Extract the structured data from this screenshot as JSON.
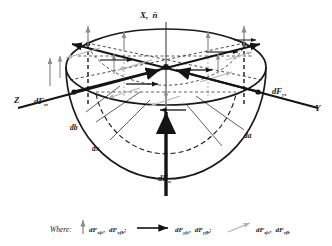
{
  "figure": {
    "title_axis_x": "X,",
    "title_axis_x_vector": "n̄",
    "axis_z": "Z",
    "axis_y": "Y",
    "force_z_tau_main": "dF",
    "force_z_tau_sub": "zτ",
    "force_y_tau_main": "dF",
    "force_y_tau_sub": "yτ",
    "force_n_main": "dF",
    "force_n_sub": "n",
    "dim_db": "db",
    "dim_dx": "dx",
    "dim_da": "da"
  },
  "legend": {
    "where_label": "Where:",
    "entries": [
      {
        "symbol": "vertical-gray-arrow",
        "color": "#8c8c8c",
        "terms": [
          {
            "main": "dF",
            "sub": "xfc"
          },
          {
            "main": "dF",
            "sub": "xfb"
          }
        ],
        "separator": ";"
      },
      {
        "symbol": "horizontal-black-arrow",
        "color": "#141414",
        "terms": [
          {
            "main": "dF",
            "sub": "yfc"
          },
          {
            "main": "dF",
            "sub": "yfb"
          }
        ],
        "separator": ";"
      },
      {
        "symbol": "diagonal-light-gray-arrow",
        "color": "#b4b4b4",
        "terms": [
          {
            "main": "dF",
            "sub": "zfc"
          },
          {
            "main": "dF",
            "sub": "zfb"
          }
        ],
        "separator": ""
      }
    ]
  },
  "colors": {
    "ink": "#1a1a1a",
    "mid_gray": "#8c8c8c",
    "light_gray": "#b4b4b4",
    "background": "#ffffff"
  }
}
